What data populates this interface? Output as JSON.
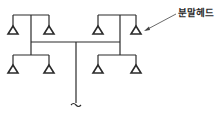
{
  "diagram": {
    "type": "piping-layout",
    "label": {
      "text": "분말헤드",
      "target": "right-top-right-head"
    },
    "colors": {
      "line": "#2a2a2a",
      "background": "#ffffff"
    },
    "branches": [
      {
        "name": "left-branch",
        "heads": [
          "top-left",
          "top-right",
          "bottom-left",
          "bottom-right"
        ]
      },
      {
        "name": "right-branch",
        "heads": [
          "top-left",
          "top-right",
          "bottom-left",
          "bottom-right"
        ]
      }
    ],
    "head_count": 8
  }
}
